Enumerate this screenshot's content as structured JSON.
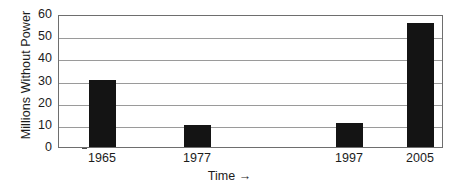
{
  "chart_data": {
    "type": "bar",
    "title": "",
    "xlabel": "Time →",
    "ylabel": "Millions Without Power",
    "categories": [
      "1965",
      "1977",
      "1997",
      "2005"
    ],
    "values": [
      30,
      10,
      11,
      56
    ],
    "ylim": [
      0,
      60
    ],
    "ytick_labels": [
      "0",
      "10",
      "20",
      "30",
      "40",
      "50",
      "60"
    ],
    "ytick_values": [
      0,
      10,
      20,
      30,
      40,
      50,
      60
    ],
    "grid": true,
    "legend": false,
    "legend_position": "none",
    "series": [
      {
        "name": "Millions Without Power",
        "values": [
          30,
          10,
          11,
          56
        ],
        "color": "#141414"
      }
    ],
    "bar_color": "#141414",
    "gridline_color": "#9a9a9a",
    "axis_color": "#6e6e6e",
    "background_color": "#ffffff",
    "bar_positions_fraction": [
      0.078,
      0.325,
      0.72,
      0.905
    ],
    "bar_width_fraction": 0.07
  },
  "axis_title_arrow_glyph": "→"
}
